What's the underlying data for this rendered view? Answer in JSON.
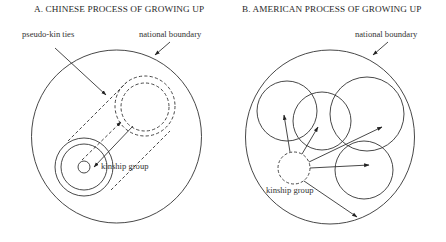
{
  "panels": [
    {
      "id": "A",
      "title": "A. CHINESE PROCESS OF GROWING UP",
      "labels": {
        "pseudo_kin": "pseudo-kin ties",
        "national_boundary": "national boundary",
        "kinship_group": "kinship group"
      }
    },
    {
      "id": "B",
      "title": "B. AMERICAN PROCESS OF GROWING UP",
      "labels": {
        "national_boundary": "national boundary",
        "kinship_group": "kinship group"
      }
    }
  ],
  "colors": {
    "stroke": "#333333",
    "text": "#2a2a2a",
    "background": "#ffffff"
  }
}
